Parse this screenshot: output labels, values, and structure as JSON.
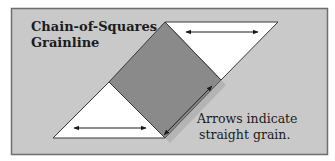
{
  "diagram": {
    "title_line1": "Chain-of-Squares",
    "title_line2": "Grainline",
    "caption_line1": "Arrows indicate",
    "caption_line2": "straight grain."
  },
  "colors": {
    "background": "#c9c9c9",
    "frame_border": "#7a7a7a",
    "square_fill": "#8a8a8a",
    "triangle_fill": "#ffffff",
    "stroke": "#3a3a3a"
  }
}
